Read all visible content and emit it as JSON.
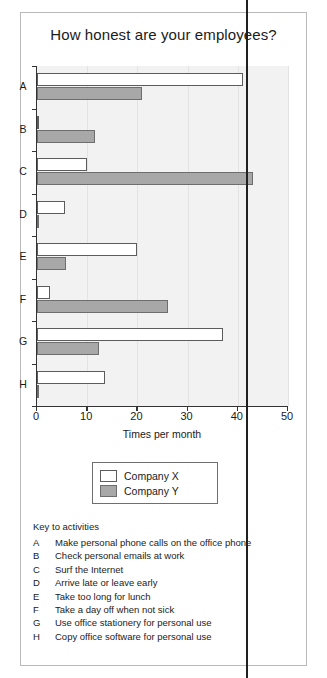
{
  "chart_data": {
    "type": "bar",
    "orientation": "horizontal",
    "title": "How honest are your employees?",
    "xlabel": "Times per month",
    "ylabel": "",
    "xlim": [
      0,
      50
    ],
    "xticks": [
      0,
      10,
      20,
      30,
      40,
      50
    ],
    "grid": "vertical",
    "legend_position": "below-axes",
    "categories": [
      "A",
      "B",
      "C",
      "D",
      "E",
      "F",
      "G",
      "H"
    ],
    "series": [
      {
        "name": "Company X",
        "color": "#ffffff",
        "values": [
          41,
          0,
          10,
          5.5,
          20,
          2.5,
          37,
          13.5
        ]
      },
      {
        "name": "Company Y",
        "color": "#a8a8a8",
        "values": [
          21,
          11.5,
          43,
          0,
          5.8,
          26,
          12.3,
          0
        ]
      }
    ]
  },
  "legend": {
    "items": [
      {
        "label": "Company X"
      },
      {
        "label": "Company Y"
      }
    ]
  },
  "key": {
    "title": "Key to activities",
    "items": [
      {
        "letter": "A",
        "text": "Make personal phone calls on the office phone"
      },
      {
        "letter": "B",
        "text": "Check personal emails at work"
      },
      {
        "letter": "C",
        "text": "Surf the Internet"
      },
      {
        "letter": "D",
        "text": "Arrive late or leave early"
      },
      {
        "letter": "E",
        "text": "Take too long for lunch"
      },
      {
        "letter": "F",
        "text": "Take a day off when not sick"
      },
      {
        "letter": "G",
        "text": "Use office stationery for personal use"
      },
      {
        "letter": "H",
        "text": "Copy office software for personal use"
      }
    ]
  }
}
